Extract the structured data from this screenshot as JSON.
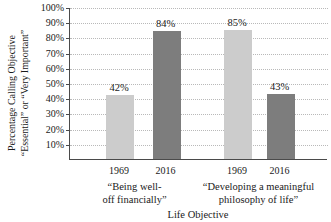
{
  "chart_data": {
    "type": "bar",
    "title": "",
    "ylabel": "Percentage Calling Objective “Essential” or “Very Important”",
    "ylabel_line1": "Percentage Calling Objective",
    "ylabel_line2": "“Essential” or “Very Important”",
    "xlabel": "Life Objective",
    "ylim": [
      0,
      100
    ],
    "ytick_labels": [
      "100%",
      "90%",
      "80%",
      "70%",
      "60%",
      "50%",
      "40%",
      "30%",
      "20%",
      "10%"
    ],
    "ytick_values": [
      100,
      90,
      80,
      70,
      60,
      50,
      40,
      30,
      20,
      10
    ],
    "grid": true,
    "legend": "none",
    "categories": [
      "1969",
      "2016",
      "1969",
      "2016"
    ],
    "values": [
      42,
      85,
      85,
      43
    ],
    "bars": [
      {
        "group": 0,
        "category": "1969",
        "value": 42,
        "label": "42%",
        "color": "#cccccc",
        "shade": "light"
      },
      {
        "group": 0,
        "category": "2016",
        "value": 84,
        "label": "84%",
        "color": "#7d7d7d",
        "shade": "dark"
      },
      {
        "group": 1,
        "category": "1969",
        "value": 85,
        "label": "85%",
        "color": "#cccccc",
        "shade": "light"
      },
      {
        "group": 1,
        "category": "2016",
        "value": 43,
        "label": "43%",
        "color": "#7d7d7d",
        "shade": "dark"
      }
    ],
    "groups": [
      {
        "line1": "“Being well-",
        "line2": "off financially”"
      },
      {
        "line1": "“Developing a meaningful",
        "line2": "philosophy of life”"
      }
    ],
    "colors": {
      "light_bar": "#cccccc",
      "dark_bar": "#7d7d7d",
      "axis": "#4a4a4a",
      "gridline": "#b9b9b9",
      "text": "#1a1a1a"
    }
  }
}
